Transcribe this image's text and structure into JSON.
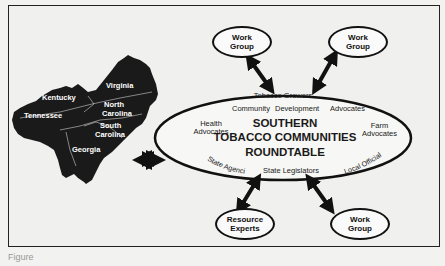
{
  "diagram": {
    "title_lines": [
      "SOUTHERN",
      "TOBACCO  COMMUNITIES",
      "ROUNDTABLE"
    ],
    "ellipse_members": {
      "top": "Tobacco Growers",
      "top_row": [
        "Community",
        "Development",
        "Advocates"
      ],
      "left": [
        "Health",
        "Advocates"
      ],
      "right": [
        "Farm",
        "Advocates"
      ],
      "bottom_left": "State Agencies",
      "bottom_center": "State Legislators",
      "bottom_right": "Local Officials"
    },
    "nodes": [
      {
        "id": "work-group-top-left",
        "lines": [
          "Work",
          "Group"
        ]
      },
      {
        "id": "work-group-top-right",
        "lines": [
          "Work",
          "Group"
        ]
      },
      {
        "id": "resource-experts",
        "lines": [
          "Resource",
          "Experts"
        ]
      },
      {
        "id": "work-group-bottom-right",
        "lines": [
          "Work",
          "Group"
        ]
      }
    ],
    "map": {
      "states": [
        "Virginia",
        "Kentucky",
        "North Carolina",
        "Tennessee",
        "South Carolina",
        "Georgia"
      ],
      "labels": {
        "virginia": "Virginia",
        "kentucky": "Kentucky",
        "nc1": "North",
        "nc2": "Carolina",
        "tennessee": "Tennessee",
        "sc1": "South",
        "sc2": "Carolina",
        "georgia": "Georgia"
      }
    },
    "colors": {
      "ink": "#111111",
      "paper": "#f0f0ee",
      "map": "#1a1a1a"
    }
  },
  "caption": "Figure"
}
